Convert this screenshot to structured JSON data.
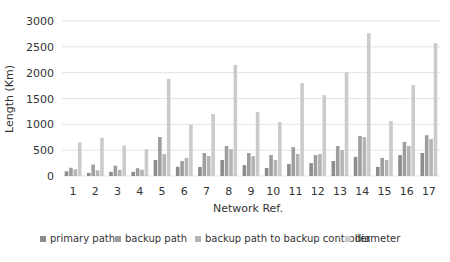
{
  "chart_data": {
    "type": "bar",
    "title": "",
    "xlabel": "Network Ref.",
    "ylabel": "Length (Km)",
    "ylim": [
      0,
      3000
    ],
    "yticks": [
      0,
      500,
      1000,
      1500,
      2000,
      2500,
      3000
    ],
    "grid": true,
    "legend_position": "bottom",
    "categories": [
      "1",
      "2",
      "3",
      "4",
      "5",
      "6",
      "7",
      "8",
      "9",
      "10",
      "11",
      "12",
      "13",
      "14",
      "15",
      "16",
      "17"
    ],
    "series": [
      {
        "name": "primary path",
        "color": "#8c8c8c",
        "values": [
          90,
          60,
          80,
          80,
          310,
          180,
          175,
          310,
          210,
          155,
          230,
          250,
          290,
          370,
          175,
          405,
          445
        ]
      },
      {
        "name": "backup path",
        "color": "#9e9e9e",
        "values": [
          160,
          220,
          200,
          150,
          755,
          290,
          445,
          580,
          445,
          405,
          560,
          405,
          580,
          775,
          350,
          660,
          790
        ]
      },
      {
        "name": "backup path to backup controller",
        "color": "#b4b4b4",
        "values": [
          130,
          110,
          120,
          120,
          425,
          350,
          385,
          520,
          385,
          310,
          425,
          425,
          500,
          755,
          310,
          580,
          715
        ]
      },
      {
        "name": "diameter",
        "color": "#cbcbcb",
        "values": [
          650,
          740,
          590,
          520,
          1880,
          990,
          1200,
          2150,
          1240,
          1045,
          1800,
          1565,
          2010,
          2765,
          1065,
          1760,
          2570
        ]
      }
    ]
  }
}
